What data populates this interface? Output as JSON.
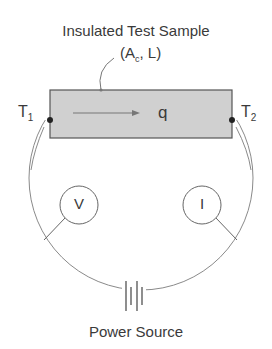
{
  "diagram": {
    "title": "Insulated Test Sample",
    "sample_params": {
      "open": "(A",
      "sub": "c",
      "close": ", L)"
    },
    "terminals": [
      {
        "label": "T",
        "sub": "1"
      },
      {
        "label": "T",
        "sub": "2"
      }
    ],
    "flow_label": "q",
    "meters": [
      {
        "symbol": "V",
        "meaning": "voltmeter"
      },
      {
        "symbol": "I",
        "meaning": "ammeter"
      }
    ],
    "source_label": "Power Source",
    "colors": {
      "sample_fill": "#d0d0d0",
      "stroke": "#555555",
      "wire": "#8a8a8a",
      "text": "#3a3a3a"
    }
  }
}
